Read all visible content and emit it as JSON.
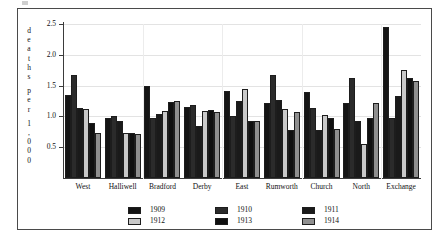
{
  "chart_data": {
    "type": "bar",
    "title": "",
    "xlabel": "",
    "ylabel": "deaths per 1,000",
    "ylabel_glyphs": [
      "d",
      "e",
      "a",
      "t",
      "h",
      "s",
      "",
      "p",
      "e",
      "r",
      "",
      "1",
      ",",
      "0",
      "0",
      "0"
    ],
    "ylim": [
      0,
      2.5
    ],
    "yticks": [
      0.5,
      1.0,
      1.5,
      2.0,
      2.5
    ],
    "ytick_labels": [
      "0.5",
      "1.0",
      "1.5",
      "2.0",
      "2.5"
    ],
    "grid": true,
    "legend_position": "bottom",
    "categories": [
      "West",
      "Halliwell",
      "Bradford",
      "Derby",
      "East",
      "Rumworth",
      "Church",
      "North",
      "Exchange"
    ],
    "series": [
      {
        "name": "1909",
        "color": "#141414",
        "values": [
          1.35,
          0.97,
          1.5,
          1.15,
          1.42,
          1.22,
          1.4,
          1.22,
          2.45
        ]
      },
      {
        "name": "1910",
        "color": "#2b2b2b",
        "values": [
          1.68,
          1.0,
          0.97,
          1.18,
          1.0,
          1.67,
          1.14,
          1.62,
          0.97
        ]
      },
      {
        "name": "1911",
        "color": "#1a1a1a",
        "values": [
          1.13,
          0.92,
          1.04,
          0.85,
          1.25,
          1.27,
          0.78,
          0.92,
          1.33
        ]
      },
      {
        "name": "1912",
        "color": "#c9c9c9",
        "values": [
          1.12,
          0.73,
          1.09,
          1.08,
          1.45,
          1.12,
          1.02,
          0.55,
          1.75
        ]
      },
      {
        "name": "1913",
        "color": "#101010",
        "values": [
          0.9,
          0.73,
          1.24,
          1.1,
          0.92,
          0.78,
          0.97,
          0.97,
          1.63
        ]
      },
      {
        "name": "1914",
        "color": "#8f8f8f",
        "values": [
          0.73,
          0.72,
          1.25,
          1.07,
          0.93,
          1.07,
          0.8,
          1.22,
          1.58
        ]
      }
    ]
  },
  "legend": {
    "entries": [
      {
        "label": "1909",
        "series": 0
      },
      {
        "label": "1910",
        "series": 1
      },
      {
        "label": "1911",
        "series": 2
      },
      {
        "label": "1912",
        "series": 3
      },
      {
        "label": "1913",
        "series": 4
      },
      {
        "label": "1914",
        "series": 5
      }
    ]
  }
}
